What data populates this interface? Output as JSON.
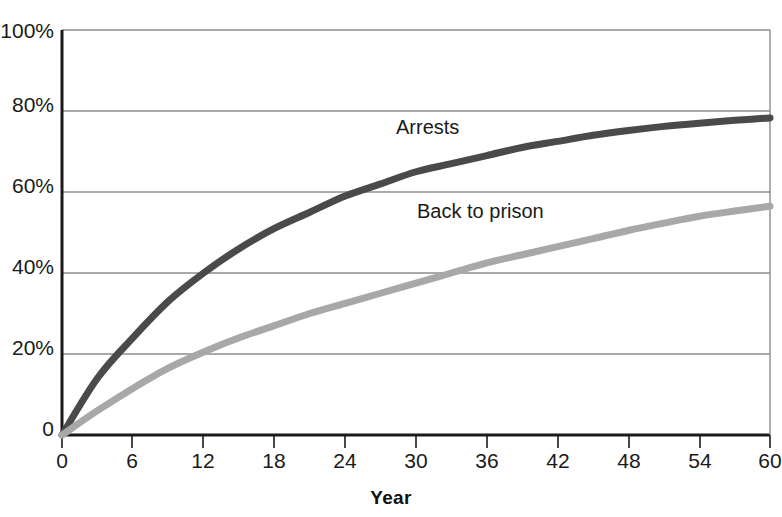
{
  "figure": {
    "title_fragment": "",
    "x_axis_title": "Year"
  },
  "axes": {
    "y_ticks": [
      "100%",
      "80%",
      "60%",
      "40%",
      "20%",
      "0"
    ],
    "y_values": [
      100,
      80,
      60,
      40,
      20,
      0
    ],
    "x_ticks": [
      "0",
      "6",
      "12",
      "18",
      "24",
      "30",
      "36",
      "42",
      "48",
      "54",
      "60"
    ],
    "x_values": [
      0,
      6,
      12,
      18,
      24,
      30,
      36,
      42,
      48,
      54,
      60
    ]
  },
  "series_labels": {
    "arrests": "Arrests",
    "back_to_prison": "Back to prison"
  },
  "colors": {
    "arrests": "#4a4a4a",
    "back_to_prison": "#a8a8a8",
    "axis": "#1a1a1a",
    "grid": "#8c8c8c",
    "background": "#ffffff"
  },
  "chart_data": {
    "type": "line",
    "title": "",
    "xlabel": "Year",
    "ylabel": "",
    "xlim": [
      0,
      60
    ],
    "ylim": [
      0,
      100
    ],
    "grid": true,
    "grid_axis": "y",
    "legend": "inline-labels",
    "x": [
      0,
      3,
      6,
      9,
      12,
      15,
      18,
      21,
      24,
      27,
      30,
      33,
      36,
      39,
      42,
      45,
      48,
      51,
      54,
      57,
      60
    ],
    "series": [
      {
        "name": "Arrests",
        "color": "#4a4a4a",
        "values": [
          0,
          14,
          24,
          33,
          40,
          46,
          51,
          55,
          59,
          62,
          65,
          67,
          69,
          71,
          72.5,
          74,
          75.2,
          76.2,
          77,
          77.7,
          78.3
        ]
      },
      {
        "name": "Back to prison",
        "color": "#a8a8a8",
        "values": [
          0,
          6,
          11.5,
          16.5,
          20.5,
          24,
          27,
          30,
          32.5,
          35,
          37.5,
          40,
          42.5,
          44.5,
          46.5,
          48.5,
          50.5,
          52.3,
          54,
          55.3,
          56.5
        ]
      }
    ],
    "annotations": [
      {
        "text": "Arrests",
        "x": 27,
        "y": 70
      },
      {
        "text": "Back to prison",
        "x": 29.5,
        "y": 52
      }
    ]
  }
}
